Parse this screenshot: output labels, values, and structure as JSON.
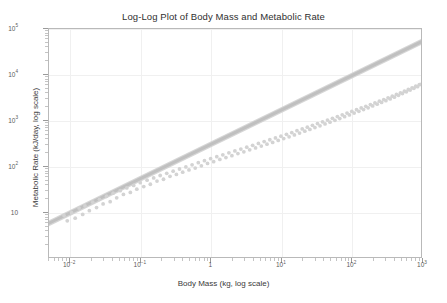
{
  "chart_data": {
    "type": "scatter",
    "title": "Log-Log Plot of Body Mass and Metabolic Rate",
    "xlabel": "Body Mass (kg, log scale)",
    "ylabel": "Metabolic Rate (kJ/day, log scale)",
    "xscale": "log",
    "yscale": "log",
    "xlim": [
      0.005,
      1000
    ],
    "ylim": [
      1,
      100000
    ],
    "grid": true,
    "legend": null,
    "x_tick_labels": [
      "10⁻²",
      "10⁻¹",
      "1",
      "10¹",
      "10²",
      "10³"
    ],
    "x_tick_values": [
      0.01,
      0.1,
      1,
      10,
      100,
      1000
    ],
    "y_tick_labels": [
      "10",
      "10²",
      "10³",
      "10⁴",
      "10⁵"
    ],
    "y_tick_values": [
      10,
      100,
      1000,
      10000,
      100000
    ],
    "point_color": "#d3d3d3",
    "line_color": "#c0c0c0",
    "band_color": "#cfcfcf",
    "frame_color": "#b9b9b9",
    "grid_color": "#f0f0f0",
    "fit": {
      "name": "power-law regression (Kleiber)",
      "intercept_kJ_per_day": 293.1,
      "slope": 0.75,
      "equation": "y = 293.1 * x^0.75"
    },
    "series": [
      {
        "name": "Species observations",
        "marker": "circle",
        "x": [
          0.0082,
          0.0091,
          0.0105,
          0.0118,
          0.0134,
          0.0151,
          0.0163,
          0.0188,
          0.021,
          0.0238,
          0.0262,
          0.0295,
          0.0331,
          0.0372,
          0.041,
          0.0461,
          0.0518,
          0.0575,
          0.0642,
          0.0721,
          0.0805,
          0.0892,
          0.0998,
          0.112,
          0.125,
          0.139,
          0.155,
          0.173,
          0.192,
          0.214,
          0.238,
          0.265,
          0.294,
          0.327,
          0.362,
          0.402,
          0.446,
          0.494,
          0.547,
          0.606,
          0.671,
          0.742,
          0.821,
          0.908,
          1.004,
          1.11,
          1.23,
          1.36,
          1.5,
          1.66,
          1.83,
          2.02,
          2.23,
          2.46,
          2.71,
          2.99,
          3.29,
          3.62,
          3.99,
          4.39,
          4.82,
          5.3,
          5.82,
          6.39,
          7.01,
          7.69,
          8.43,
          9.23,
          10.1,
          11.05,
          12.1,
          13.2,
          14.4,
          15.7,
          17.1,
          18.6,
          20.3,
          22.1,
          24.0,
          26.1,
          28.4,
          30.8,
          33.5,
          36.4,
          39.5,
          42.9,
          46.5,
          50.5,
          54.7,
          59.3,
          64.3,
          69.6,
          75.4,
          81.6,
          88.3,
          95.5,
          103.3,
          111.6,
          120.6,
          130.2,
          140.6,
          151.7,
          163.6,
          176.4,
          190.1,
          204.8,
          220.5,
          237.3,
          255.2,
          274.3,
          294.7,
          316.3,
          339.3,
          363.8,
          389.7,
          417.2,
          446.3,
          477.1,
          509.7,
          544.1,
          580.4,
          618.7,
          659.0,
          701.4,
          746.0,
          792.8,
          842.0,
          893.6,
          947.7,
          1000.0
        ],
        "y": [
          8.1,
          6.2,
          9.4,
          7.1,
          11.8,
          8.6,
          13.2,
          10.4,
          15.9,
          12.1,
          18.4,
          14.6,
          21.5,
          16.3,
          25.1,
          19.8,
          28.4,
          23.6,
          32.7,
          26.1,
          37.2,
          30.8,
          42.6,
          35.1,
          48.3,
          39.4,
          54.1,
          46.2,
          61.3,
          50.7,
          68.4,
          58.9,
          76.2,
          64.5,
          85.1,
          72.3,
          94.6,
          81.0,
          105.2,
          89.4,
          117.1,
          99.8,
          129.4,
          112.6,
          143.0,
          123.1,
          158.4,
          137.9,
          174.2,
          152.0,
          192.6,
          166.3,
          212.1,
          185.4,
          233.0,
          202.8,
          256.7,
          224.1,
          281.2,
          246.9,
          309.4,
          270.3,
          339.0,
          298.1,
          372.5,
          326.4,
          408.2,
          360.8,
          447.3,
          395.0,
          490.1,
          433.2,
          536.8,
          476.4,
          588.0,
          522.1,
          643.5,
          574.0,
          704.6,
          628.8,
          771.0,
          690.4,
          843.2,
          755.1,
          922.0,
          828.6,
          1007.4,
          906.2,
          1100.5,
          994.1,
          1201.2,
          1087.5,
          1311.0,
          1192.4,
          1430.4,
          1304.8,
          1560.0,
          1430.2,
          1700.9,
          1564.6,
          1854.2,
          1713.0,
          2020.1,
          1872.5,
          2200.6,
          2050.3,
          2396.8,
          2240.1,
          2610.4,
          2452.9,
          2842.3,
          2680.2,
          3094.6,
          2934.1,
          3368.1,
          3205.4,
          3665.2,
          3505.0,
          3986.9,
          3827.3,
          4335.6,
          4184.2,
          4713.0,
          4567.1,
          5121.3,
          4988.6,
          5562.5,
          5441.2,
          6039.7,
          6100.0
        ],
        "n": 130
      }
    ]
  }
}
